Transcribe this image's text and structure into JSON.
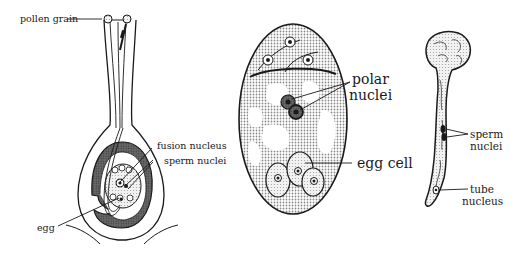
{
  "figures": [
    {
      "id": "pistil",
      "labels": {
        "pollen_grain": "pollen grain",
        "fusion_nucleus": "fusion nucleus",
        "sperm_nuclei": "sperm nuclei",
        "egg": "egg"
      }
    },
    {
      "id": "embryo_sac",
      "labels": {
        "polar_line1": "polar",
        "polar_line2": "nuclei",
        "egg_cell": "egg cell"
      }
    },
    {
      "id": "pollen_tube",
      "labels": {
        "sperm_line1": "sperm",
        "sperm_line2": "nuclei",
        "tube_line1": "tube",
        "tube_line2": "nucleus"
      }
    }
  ],
  "colors": {
    "ink": "#1a1a1a",
    "stipple": "#9a9a9a",
    "dark_fill": "#555555",
    "light_fill": "#d8d8d8"
  }
}
